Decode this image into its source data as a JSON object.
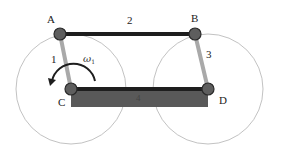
{
  "diagram": {
    "type": "four-bar linkage",
    "colors": {
      "circle_stroke": "#b3b3b3",
      "coupler_link": "#1e1e1e",
      "crank_link": "#a9a9a9",
      "ground_link_fill": "#595959",
      "ground_link_top": "#1e1e1e",
      "joint_fill": "#5e5e5e",
      "joint_stroke": "#2a2a2a",
      "arrow": "#1e1e1e"
    },
    "joints": [
      {
        "id": "A",
        "label": "A"
      },
      {
        "id": "B",
        "label": "B"
      },
      {
        "id": "C",
        "label": "C"
      },
      {
        "id": "D",
        "label": "D"
      }
    ],
    "links": [
      {
        "id": "1",
        "label": "1",
        "from": "C",
        "to": "A",
        "role": "crank"
      },
      {
        "id": "2",
        "label": "2",
        "from": "A",
        "to": "B",
        "role": "coupler"
      },
      {
        "id": "3",
        "label": "3",
        "from": "B",
        "to": "D",
        "role": "rocker"
      },
      {
        "id": "4",
        "label": "4",
        "from": "C",
        "to": "D",
        "role": "ground"
      }
    ],
    "angular_velocity": {
      "symbol": "ω",
      "subscript": "1",
      "direction": "counter-clockwise",
      "about": "C"
    },
    "path_circles": [
      {
        "center": "C",
        "through": "A"
      },
      {
        "center": "D",
        "through": "B"
      }
    ]
  }
}
